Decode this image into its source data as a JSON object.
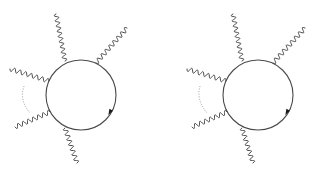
{
  "figure": {
    "width": 316,
    "height": 174,
    "background": "#ffffff",
    "line_color": "#4a4a4a",
    "dotted_color": "#9a9a9a",
    "arrow_color": "#1a1a1a"
  },
  "diagrams": [
    {
      "name": "left-diagram",
      "loop": {
        "cx": 81,
        "cy": 95,
        "r": 35
      },
      "photons": [
        {
          "name": "photon-top",
          "x1": 65,
          "y1": 61,
          "x2": 56,
          "y2": 14,
          "waves": 9
        },
        {
          "name": "photon-upper-right",
          "x1": 96,
          "y1": 63,
          "x2": 127,
          "y2": 28,
          "waves": 8
        },
        {
          "name": "photon-upper-left",
          "x1": 49,
          "y1": 81,
          "x2": 10,
          "y2": 69,
          "waves": 7
        },
        {
          "name": "photon-lower-left",
          "x1": 50,
          "y1": 112,
          "x2": 15,
          "y2": 127,
          "waves": 7
        },
        {
          "name": "photon-bottom",
          "x1": 65,
          "y1": 128,
          "x2": 77,
          "y2": 163,
          "waves": 7
        }
      ],
      "dotted_arc": {
        "x1": 24,
        "y1": 86,
        "cx": 19,
        "cy": 100,
        "x2": 30,
        "y2": 113
      },
      "arrow": {
        "x": 110,
        "y": 112,
        "angle": 118
      }
    },
    {
      "name": "right-diagram",
      "loop": {
        "cx": 258,
        "cy": 95,
        "r": 35
      },
      "photons": [
        {
          "name": "photon-top",
          "x1": 242,
          "y1": 61,
          "x2": 233,
          "y2": 14,
          "waves": 9
        },
        {
          "name": "photon-upper-right",
          "x1": 273,
          "y1": 63,
          "x2": 305,
          "y2": 28,
          "waves": 8
        },
        {
          "name": "photon-upper-left",
          "x1": 226,
          "y1": 81,
          "x2": 187,
          "y2": 69,
          "waves": 7
        },
        {
          "name": "photon-lower-left",
          "x1": 227,
          "y1": 112,
          "x2": 192,
          "y2": 127,
          "waves": 7
        },
        {
          "name": "photon-bottom",
          "x1": 242,
          "y1": 128,
          "x2": 253,
          "y2": 163,
          "waves": 7
        }
      ],
      "dotted_arc": {
        "x1": 200,
        "y1": 86,
        "cx": 196,
        "cy": 100,
        "x2": 207,
        "y2": 113
      },
      "arrow": {
        "x": 287,
        "y": 112,
        "angle": 118
      }
    }
  ]
}
